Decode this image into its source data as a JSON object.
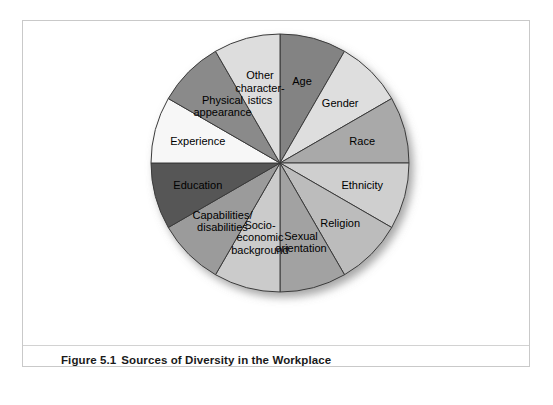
{
  "figure": {
    "caption_number": "Figure 5.1",
    "caption_text": "Sources of Diversity in the Workplace"
  },
  "chart_data": {
    "type": "pie",
    "title": "Sources of Diversity in the Workplace",
    "subtitle": "",
    "xlabel": "",
    "ylabel": "",
    "legend_position": "none",
    "grid": false,
    "labels_placement": "inside-slices",
    "start_angle_deg": 0,
    "direction": "clockwise",
    "total_slices": 12,
    "equal_slices": true,
    "slice_angle_deg": 30,
    "categories": [
      "Age",
      "Gender",
      "Race",
      "Ethnicity",
      "Religion",
      "Sexual orientation",
      "Socio-economic background",
      "Capabilities/disabilities",
      "Education",
      "Experience",
      "Physical appearance",
      "Other characteristics"
    ],
    "values": [
      8.33,
      8.33,
      8.33,
      8.33,
      8.33,
      8.33,
      8.33,
      8.33,
      8.33,
      8.33,
      8.33,
      8.33
    ],
    "value_unit": "percent",
    "slices": [
      {
        "label": "Age",
        "display_label": "Age",
        "value": 8.33,
        "start_deg": 0,
        "end_deg": 30,
        "color": "#838383"
      },
      {
        "label": "Gender",
        "display_label": "Gender",
        "value": 8.33,
        "start_deg": 30,
        "end_deg": 60,
        "color": "#dedede"
      },
      {
        "label": "Race",
        "display_label": "Race",
        "value": 8.33,
        "start_deg": 60,
        "end_deg": 90,
        "color": "#a9a9a9"
      },
      {
        "label": "Ethnicity",
        "display_label": "Ethnicity",
        "value": 8.33,
        "start_deg": 90,
        "end_deg": 120,
        "color": "#cfcfcf"
      },
      {
        "label": "Religion",
        "display_label": "Religion",
        "value": 8.33,
        "start_deg": 120,
        "end_deg": 150,
        "color": "#bcbcbc"
      },
      {
        "label": "Sexual orientation",
        "display_label": "Sexual\norientation",
        "value": 8.33,
        "start_deg": 150,
        "end_deg": 180,
        "color": "#a2a2a2"
      },
      {
        "label": "Socio-economic background",
        "display_label": "Socio-\neconomic\nbackground",
        "value": 8.33,
        "start_deg": 180,
        "end_deg": 210,
        "color": "#cbcbcb"
      },
      {
        "label": "Capabilities/disabilities",
        "display_label": "Capabilities/\ndisabilities",
        "value": 8.33,
        "start_deg": 210,
        "end_deg": 240,
        "color": "#9b9b9b"
      },
      {
        "label": "Education",
        "display_label": "Education",
        "value": 8.33,
        "start_deg": 240,
        "end_deg": 270,
        "color": "#575757"
      },
      {
        "label": "Experience",
        "display_label": "Experience",
        "value": 8.33,
        "start_deg": 270,
        "end_deg": 300,
        "color": "#f7f7f7"
      },
      {
        "label": "Physical appearance",
        "display_label": "Physical\nappearance",
        "value": 8.33,
        "start_deg": 300,
        "end_deg": 330,
        "color": "#8a8a8a"
      },
      {
        "label": "Other characteristics",
        "display_label": "Other\ncharacter-\nistics",
        "value": 8.33,
        "start_deg": 330,
        "end_deg": 360,
        "color": "#dddddd"
      }
    ],
    "style": {
      "outline_color": "#3a3a3a",
      "background": "#ffffff",
      "panel_border": "#c9c9c9",
      "drop_shadow": true
    }
  }
}
